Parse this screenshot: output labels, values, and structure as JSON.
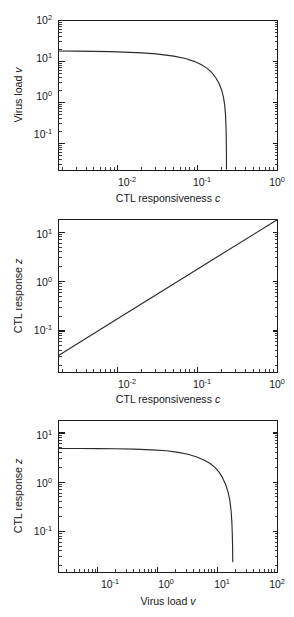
{
  "figure": {
    "background": "#ffffff",
    "line_color": "#2b2b2b",
    "axis_color": "#1b1b1b",
    "panel_count": 3
  },
  "panels": [
    {
      "id": "panel-1",
      "xlabel_prefix": "CTL responsiveness ",
      "xlabel_symbol": "c",
      "ylabel_prefix": "Virus load ",
      "ylabel_symbol": "v",
      "x_ticklabels": [
        "10-2",
        "10-1",
        "100"
      ],
      "y_ticklabels": [
        "10-1",
        "100",
        "101",
        "102"
      ]
    },
    {
      "id": "panel-2",
      "xlabel_prefix": "CTL responsiveness ",
      "xlabel_symbol": "c",
      "ylabel_prefix": "CTL response ",
      "ylabel_symbol": "z",
      "x_ticklabels": [
        "10-2",
        "10-1",
        "100"
      ],
      "y_ticklabels": [
        "10-1",
        "100",
        "101"
      ]
    },
    {
      "id": "panel-3",
      "xlabel_prefix": "Virus load ",
      "xlabel_symbol": "v",
      "ylabel_prefix": "CTL response ",
      "ylabel_symbol": "z",
      "x_ticklabels": [
        "10-1",
        "100",
        "101",
        "102"
      ],
      "y_ticklabels": [
        "10-1",
        "100",
        "101"
      ]
    }
  ],
  "chart_data": [
    {
      "type": "line",
      "title": "",
      "xlabel": "CTL responsiveness c",
      "ylabel": "Virus load v",
      "xscale": "log",
      "yscale": "log",
      "xlim": [
        0.0018,
        1.0
      ],
      "ylim": [
        0.022,
        100.0
      ],
      "xticks": [
        0.01,
        0.1,
        1.0
      ],
      "xticklabels": [
        "10^-2",
        "10^-1",
        "10^0"
      ],
      "yticks": [
        0.1,
        1.0,
        10.0,
        100.0
      ],
      "yticklabels": [
        "10^-1",
        "10^0",
        "10^1",
        "10^2"
      ],
      "grid": false,
      "legend": false,
      "series": [
        {
          "name": "virus load vs CTL responsiveness",
          "x": [
            0.0018,
            0.003,
            0.005,
            0.008,
            0.012,
            0.02,
            0.03,
            0.05,
            0.07,
            0.09,
            0.11,
            0.13,
            0.15,
            0.17,
            0.185,
            0.2,
            0.21,
            0.218,
            0.223,
            0.226,
            0.228,
            0.229,
            0.2295
          ],
          "y": [
            18.0,
            17.9,
            17.7,
            17.4,
            17.0,
            16.2,
            15.3,
            13.5,
            11.8,
            10.1,
            8.5,
            6.9,
            5.4,
            3.9,
            2.9,
            2.0,
            1.35,
            0.85,
            0.5,
            0.28,
            0.13,
            0.06,
            0.024
          ]
        }
      ]
    },
    {
      "type": "line",
      "title": "",
      "xlabel": "CTL responsiveness c",
      "ylabel": "CTL response z",
      "xscale": "log",
      "yscale": "log",
      "xlim": [
        0.0018,
        1.0
      ],
      "ylim": [
        0.0145,
        18.0
      ],
      "xticks": [
        0.01,
        0.1,
        1.0
      ],
      "xticklabels": [
        "10^-2",
        "10^-1",
        "10^0"
      ],
      "yticks": [
        0.1,
        1.0,
        10.0
      ],
      "yticklabels": [
        "10^-1",
        "10^0",
        "10^1"
      ],
      "grid": false,
      "legend": false,
      "series": [
        {
          "name": "CTL response vs CTL responsiveness",
          "x": [
            0.0018,
            0.01,
            0.1,
            1.0
          ],
          "y": [
            0.032,
            0.18,
            1.8,
            18.0
          ]
        }
      ]
    },
    {
      "type": "line",
      "title": "",
      "xlabel": "Virus load v",
      "ylabel": "CTL response z",
      "xscale": "log",
      "yscale": "log",
      "xlim": [
        0.022,
        100.0
      ],
      "ylim": [
        0.0145,
        18.0
      ],
      "xticks": [
        0.1,
        1.0,
        10.0,
        100.0
      ],
      "xticklabels": [
        "10^-1",
        "10^0",
        "10^1",
        "10^2"
      ],
      "yticks": [
        0.1,
        1.0,
        10.0
      ],
      "yticklabels": [
        "10^-1",
        "10^0",
        "10^1"
      ],
      "grid": false,
      "legend": false,
      "series": [
        {
          "name": "CTL response vs virus load",
          "x": [
            0.022,
            0.05,
            0.1,
            0.2,
            0.4,
            0.8,
            1.4,
            2.2,
            3.2,
            4.5,
            6.0,
            7.5,
            9.0,
            10.5,
            12.0,
            13.5,
            15.0,
            16.0,
            16.8,
            17.3,
            17.6,
            17.8,
            17.9
          ],
          "y": [
            4.85,
            4.84,
            4.82,
            4.78,
            4.7,
            4.55,
            4.35,
            4.05,
            3.7,
            3.25,
            2.8,
            2.4,
            2.0,
            1.62,
            1.25,
            0.92,
            0.62,
            0.42,
            0.26,
            0.15,
            0.085,
            0.045,
            0.024
          ]
        }
      ]
    }
  ]
}
